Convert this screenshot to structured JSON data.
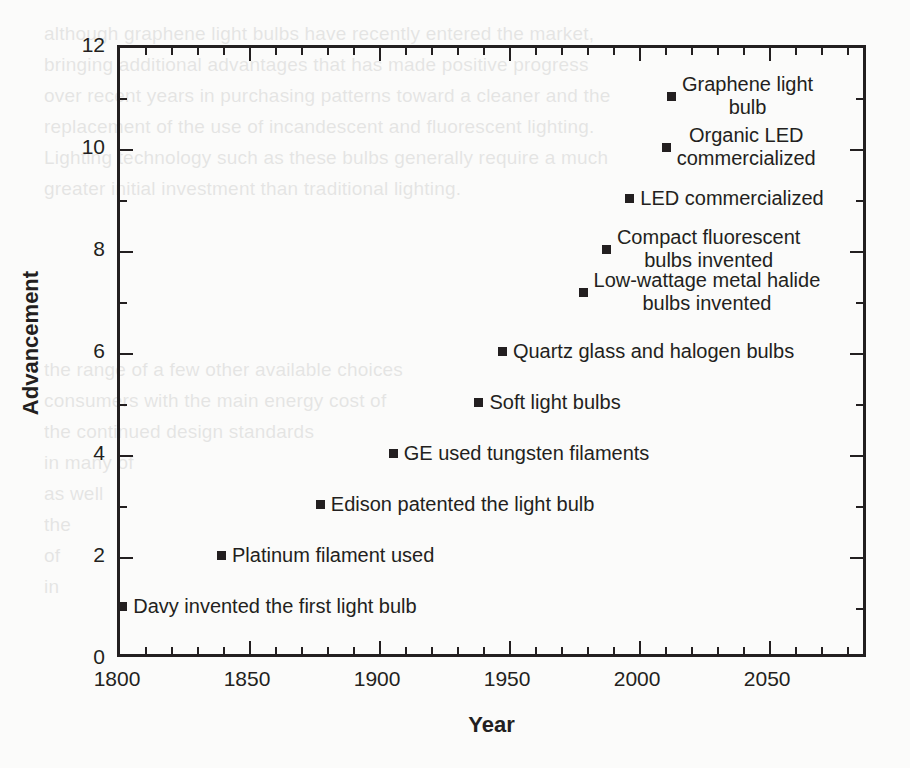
{
  "chart_data": {
    "type": "scatter",
    "title": "",
    "xlabel": "Year",
    "ylabel": "Advancement",
    "xlim": [
      1800,
      2088
    ],
    "ylim": [
      0,
      12
    ],
    "grid": false,
    "legend": "none",
    "x_major_ticks": [
      1800,
      1850,
      1900,
      1950,
      2000,
      2050
    ],
    "x_tick_labels": [
      "1800",
      "1850",
      "1900",
      "1950",
      "2000",
      "2050"
    ],
    "x_minor_step": 10,
    "y_major_ticks": [
      0,
      2,
      4,
      6,
      8,
      10,
      12
    ],
    "y_tick_labels": [
      "0",
      "2",
      "4",
      "6",
      "8",
      "10",
      "12"
    ],
    "y_minor_step": 1,
    "points": [
      {
        "x": 1802,
        "y": 1,
        "label": "Davy invented the first light bulb",
        "lines": [
          "Davy invented the first light bulb"
        ]
      },
      {
        "x": 1840,
        "y": 2,
        "label": "Platinum filament used",
        "lines": [
          "Platinum filament used"
        ]
      },
      {
        "x": 1878,
        "y": 3,
        "label": "Edison patented the light bulb",
        "lines": [
          "Edison patented the light bulb"
        ]
      },
      {
        "x": 1906,
        "y": 4,
        "label": "GE used tungsten filaments",
        "lines": [
          "GE used tungsten filaments"
        ]
      },
      {
        "x": 1939,
        "y": 5,
        "label": "Soft light bulbs",
        "lines": [
          "Soft light bulbs"
        ]
      },
      {
        "x": 1948,
        "y": 6,
        "label": "Quartz glass and halogen bulbs",
        "lines": [
          "Quartz glass and halogen bulbs"
        ]
      },
      {
        "x": 1979,
        "y": 7.15,
        "label": "Low-wattage metal halide bulbs invented",
        "lines": [
          "Low-wattage metal halide",
          "bulbs invented"
        ]
      },
      {
        "x": 1988,
        "y": 8,
        "label": "Compact fluorescent bulbs invented",
        "lines": [
          "Compact fluorescent",
          "bulbs invented"
        ]
      },
      {
        "x": 1997,
        "y": 9,
        "label": "LED commercialized",
        "lines": [
          "LED commercialized"
        ]
      },
      {
        "x": 2011,
        "y": 10,
        "label": "Organic LED commercialized",
        "lines": [
          "Organic LED",
          "commercialized"
        ]
      },
      {
        "x": 2013,
        "y": 11,
        "label": "Graphene light bulb",
        "lines": [
          "Graphene light",
          "bulb"
        ]
      }
    ],
    "colors": {
      "marker": "#231f20",
      "axis": "#231f20",
      "text": "#231f20",
      "background": "#fbfbfa"
    }
  },
  "background_bleed": {
    "note": "faint show-through text from the reverse side of the scanned page",
    "lines": [
      {
        "text": "although graphene light bulbs have recently entered the market,",
        "x": 44,
        "y": 18
      },
      {
        "text": "bringing additional advantages that has made positive progress",
        "x": 44,
        "y": 49
      },
      {
        "text": "over recent years in purchasing patterns toward a cleaner and the",
        "x": 44,
        "y": 80
      },
      {
        "text": "replacement of the use of incandescent and fluorescent lighting.",
        "x": 44,
        "y": 111
      },
      {
        "text": "Lighting technology such as these bulbs generally require a much",
        "x": 44,
        "y": 142
      },
      {
        "text": "greater initial investment than traditional lighting.",
        "x": 44,
        "y": 173
      },
      {
        "text": "the range of a few other available choices",
        "x": 44,
        "y": 354
      },
      {
        "text": "consumers with the main energy cost of",
        "x": 44,
        "y": 385
      },
      {
        "text": "the continued design standards",
        "x": 44,
        "y": 416
      },
      {
        "text": "in many of",
        "x": 44,
        "y": 447
      },
      {
        "text": "as well",
        "x": 44,
        "y": 478
      },
      {
        "text": "the",
        "x": 44,
        "y": 509
      },
      {
        "text": "of",
        "x": 44,
        "y": 540
      },
      {
        "text": "in",
        "x": 44,
        "y": 571
      }
    ]
  }
}
